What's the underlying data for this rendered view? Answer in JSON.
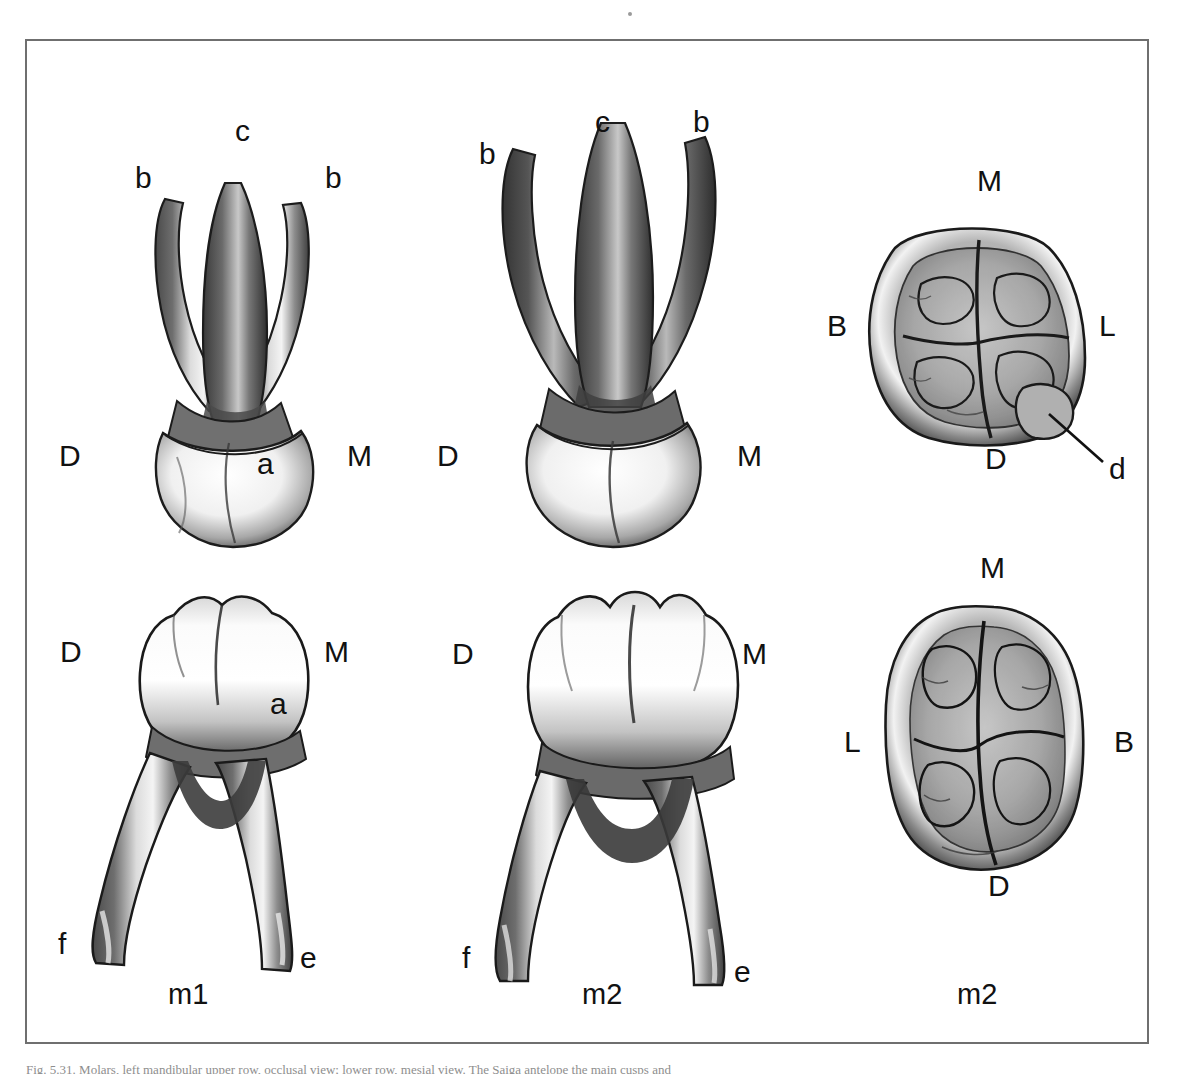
{
  "figure": {
    "border_color": "#6f6f6f",
    "background": "#ffffff",
    "caption_text": "Fig. 5.31. Molars, left mandibular upper row, occlusal view; lower row, mesial view. The Saiga antelope the main cusps and"
  },
  "columns": [
    {
      "caption": "m1"
    },
    {
      "caption": "m2"
    },
    {
      "caption": "m2"
    }
  ],
  "panels": [
    {
      "id": "upper-m1",
      "name": "upper-first-molar-buccal-view",
      "labels": [
        {
          "key": "b-left",
          "text": "b"
        },
        {
          "key": "c-apex",
          "text": "c"
        },
        {
          "key": "b-right",
          "text": "b"
        },
        {
          "key": "d-side",
          "text": "D"
        },
        {
          "key": "a-cusp",
          "text": "a"
        },
        {
          "key": "m-side",
          "text": "M"
        }
      ]
    },
    {
      "id": "upper-m2",
      "name": "upper-second-molar-buccal-view",
      "labels": [
        {
          "key": "b-left",
          "text": "b"
        },
        {
          "key": "c-apex",
          "text": "c"
        },
        {
          "key": "b-right",
          "text": "b"
        },
        {
          "key": "d-side",
          "text": "D"
        },
        {
          "key": "m-side",
          "text": "M"
        }
      ]
    },
    {
      "id": "occlusal-upper-m2",
      "name": "upper-second-molar-occlusal-view",
      "labels": [
        {
          "key": "m-top",
          "text": "M"
        },
        {
          "key": "b-left",
          "text": "B"
        },
        {
          "key": "l-right",
          "text": "L"
        },
        {
          "key": "d-bottom",
          "text": "D"
        },
        {
          "key": "d-cusp",
          "text": "d"
        }
      ]
    },
    {
      "id": "lower-m1",
      "name": "lower-first-molar-mesial-view",
      "labels": [
        {
          "key": "d-side",
          "text": "D"
        },
        {
          "key": "m-side",
          "text": "M"
        },
        {
          "key": "a-cusp",
          "text": "a"
        },
        {
          "key": "f-root",
          "text": "f"
        },
        {
          "key": "e-root",
          "text": "e"
        }
      ]
    },
    {
      "id": "lower-m2",
      "name": "lower-second-molar-mesial-view",
      "labels": [
        {
          "key": "d-side",
          "text": "D"
        },
        {
          "key": "m-side",
          "text": "M"
        },
        {
          "key": "f-root",
          "text": "f"
        },
        {
          "key": "e-root",
          "text": "e"
        }
      ]
    },
    {
      "id": "occlusal-lower-m2",
      "name": "lower-second-molar-occlusal-view",
      "labels": [
        {
          "key": "m-top",
          "text": "M"
        },
        {
          "key": "l-left",
          "text": "L"
        },
        {
          "key": "b-right",
          "text": "B"
        },
        {
          "key": "d-bottom",
          "text": "D"
        }
      ]
    }
  ]
}
